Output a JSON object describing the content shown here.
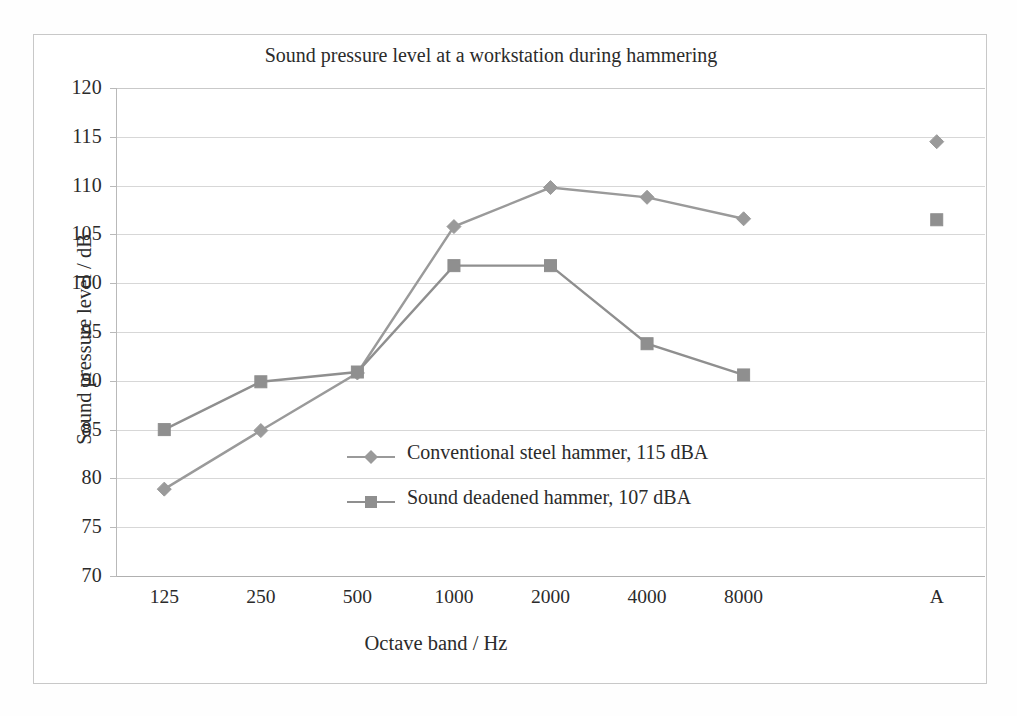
{
  "chart_data": {
    "type": "line",
    "title": "Sound pressure level at a workstation during hammering",
    "xlabel": "Octave band / Hz",
    "ylabel": "Sound pressure level / dB",
    "categories": [
      "125",
      "250",
      "500",
      "1000",
      "2000",
      "4000",
      "8000",
      "",
      "A"
    ],
    "ylim": [
      70,
      120
    ],
    "yticks": [
      "120",
      "115",
      "110",
      "105",
      "100",
      "95",
      "90",
      "85",
      "80",
      "75",
      "70"
    ],
    "grid": true,
    "legend_position": "inside-center",
    "series": [
      {
        "name": "Conventional steel hammer, 115 dBA",
        "marker": "diamond",
        "color": "#9a9a9a",
        "values": [
          78.9,
          84.9,
          90.8,
          105.8,
          109.8,
          108.8,
          106.6,
          null,
          114.5
        ]
      },
      {
        "name": "Sound deadened hammer, 107 dBA",
        "marker": "square",
        "color": "#8f8f8f",
        "values": [
          85.0,
          89.9,
          90.9,
          101.8,
          101.8,
          93.8,
          90.6,
          null,
          106.5
        ]
      }
    ]
  },
  "colors": {
    "series1": "#9a9a9a",
    "series2": "#8f8f8f",
    "grid": "#d7d7d7",
    "axis": "#b0b0b0",
    "frame": "#c8c8c8",
    "text": "#2b2b2b"
  }
}
